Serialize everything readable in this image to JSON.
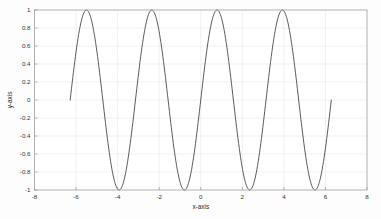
{
  "figure": {
    "background_color": "#fdfdfd",
    "plot_background_color": "#ffffff",
    "axes_border_color": "#9aa0a6",
    "grid_color": "#e4e8ef",
    "curve_color": "#4a4a4a",
    "tick_label_color": "#333333"
  },
  "chart_data": {
    "type": "line",
    "title": "",
    "xlabel": "x-axis",
    "ylabel": "y-axis",
    "xlim": [
      -8,
      8
    ],
    "ylim": [
      -1,
      1
    ],
    "grid": true,
    "legend": null,
    "xticks": [
      -8,
      -6,
      -4,
      -2,
      0,
      2,
      4,
      6,
      8
    ],
    "xtick_labels": [
      "-8",
      "-6",
      "-4",
      "-2",
      "0",
      "2",
      "4",
      "6",
      "8"
    ],
    "yticks": [
      -1,
      -0.8,
      -0.6,
      -0.4,
      -0.2,
      0,
      0.2,
      0.4,
      0.6,
      0.8,
      1
    ],
    "ytick_labels": [
      "-1",
      "-0.8",
      "-0.6",
      "-0.4",
      "-0.2",
      "0",
      "0.2",
      "0.4",
      "0.6",
      "0.8",
      "1"
    ],
    "series": [
      {
        "name": "sin(2x)",
        "expression": "y = sin(2x)",
        "x_start": -6.2832,
        "x_end": 6.2832,
        "amplitude": 1,
        "angular_frequency": 2,
        "phase": 0,
        "num_points": 400,
        "color": "#4a4a4a",
        "line_width": 0.9,
        "peaks_x": [
          -5.4978,
          -2.3562,
          0.7854,
          3.927
        ],
        "peaks_y": [
          1,
          1,
          1,
          1
        ],
        "troughs_x": [
          -3.927,
          -0.7854,
          2.3562,
          5.4978
        ],
        "troughs_y": [
          -1,
          -1,
          -1,
          -1
        ],
        "endpoints": [
          {
            "x": -6.2832,
            "y": 0
          },
          {
            "x": 6.2832,
            "y": 0
          }
        ]
      }
    ]
  }
}
